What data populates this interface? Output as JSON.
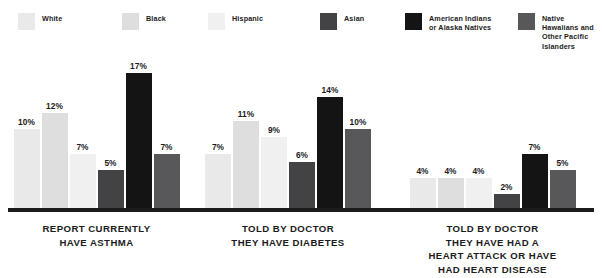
{
  "chart_data": {
    "type": "bar",
    "title": "",
    "xlabel": "",
    "ylabel": "",
    "ylim": [
      0,
      17
    ],
    "grid": false,
    "legend_position": "top",
    "value_suffix": "%",
    "categories": [
      "REPORT CURRENTLY\nHAVE ASTHMA",
      "TOLD BY DOCTOR\nTHEY HAVE DIABETES",
      "TOLD BY DOCTOR\nTHEY HAVE HAD A\nHEART ATTACK OR HAVE\nHAD HEART DISEASE"
    ],
    "series": [
      {
        "name": "White",
        "color": "#e9e9e9",
        "values": [
          10,
          7,
          4
        ],
        "labels": [
          "10%",
          "7%",
          "4%"
        ]
      },
      {
        "name": "Black",
        "color": "#dededf",
        "values": [
          12,
          11,
          4
        ],
        "labels": [
          "12%",
          "11%",
          "4%"
        ]
      },
      {
        "name": "Hispanic",
        "color": "#f0f0f0",
        "values": [
          7,
          9,
          4
        ],
        "labels": [
          "7%",
          "9%",
          "4%"
        ]
      },
      {
        "name": "Asian",
        "color": "#434345",
        "values": [
          5,
          6,
          2
        ],
        "labels": [
          "5%",
          "6%",
          "2%"
        ]
      },
      {
        "name": "American Indians\nor Alaska Natives",
        "color": "#141414",
        "values": [
          17,
          14,
          7
        ],
        "labels": [
          "17%",
          "14%",
          "7%"
        ]
      },
      {
        "name": "Native Hawaiians and\nOther Pacific Islanders",
        "color": "#58585a",
        "values": [
          7,
          10,
          5
        ],
        "labels": [
          "7%",
          "10%",
          "5%"
        ]
      }
    ]
  },
  "legend": {
    "items": [
      {
        "label": "White",
        "color": "#e9e9e9"
      },
      {
        "label": "Black",
        "color": "#dededf"
      },
      {
        "label": "Hispanic",
        "color": "#f0f0f0"
      },
      {
        "label": "Asian",
        "color": "#434345"
      },
      {
        "label": "American Indians\nor Alaska Natives",
        "color": "#141414"
      },
      {
        "label": "Native Hawaiians and\nOther Pacific Islanders",
        "color": "#58585a"
      }
    ]
  },
  "colors": {
    "background": "#ffffff",
    "baseline": "#1c1c1c",
    "text": "#1a1a1a"
  }
}
